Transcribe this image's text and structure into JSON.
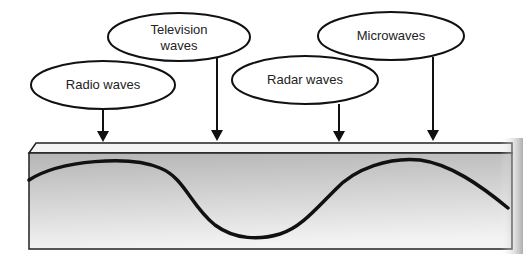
{
  "diagram": {
    "labels": [
      {
        "id": "radio",
        "text": "Radio waves"
      },
      {
        "id": "television_line1",
        "text": "Television"
      },
      {
        "id": "television_line2",
        "text": "waves"
      },
      {
        "id": "radar",
        "text": "Radar waves"
      },
      {
        "id": "microwaves",
        "text": "Microwaves"
      }
    ],
    "colors": {
      "stroke": "#111111",
      "box_gradient_top": "#b8b8b8",
      "box_gradient_bottom": "#f2f2f2",
      "box_top_face": "#f4f4f4"
    }
  }
}
